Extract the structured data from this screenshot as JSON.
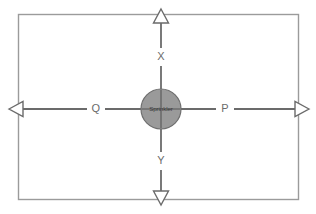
{
  "diagram": {
    "background_color": "#ffffff",
    "frame": {
      "name": "outer-border",
      "stroke_color": "#9b9b9b",
      "x": 18,
      "y": 14,
      "width": 281,
      "height": 186
    },
    "center": {
      "label": "Sprinkler",
      "fill_color": "#9a9a9a",
      "stroke_color": "#6e6e6e",
      "cx": 161,
      "cy": 109,
      "r": 20
    },
    "axes": {
      "line_color": "#6b6b6b",
      "arrowhead_fill": "#ffffff",
      "arrowhead_stroke": "#6b6b6b",
      "horizontal": {
        "name": "horizontal-axis",
        "y": 109,
        "x_start": 10,
        "x_end": 308
      },
      "vertical": {
        "name": "vertical-axis",
        "x": 161,
        "y_start": 10,
        "y_end": 204
      }
    },
    "labels": [
      {
        "id": "x",
        "text": "X",
        "x": 161,
        "y": 57,
        "direction": "up"
      },
      {
        "id": "p",
        "text": "P",
        "x": 225,
        "y": 109,
        "direction": "right"
      },
      {
        "id": "q",
        "text": "Q",
        "x": 96,
        "y": 109,
        "direction": "left"
      },
      {
        "id": "y",
        "text": "Y",
        "x": 161,
        "y": 161,
        "direction": "down"
      }
    ]
  }
}
